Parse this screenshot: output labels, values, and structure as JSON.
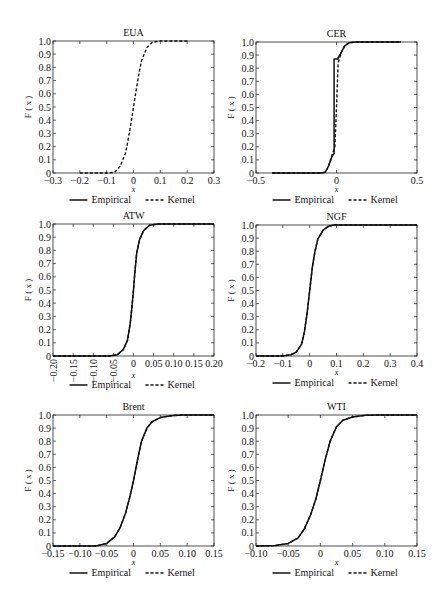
{
  "figure": {
    "legend": {
      "empirical_label": "Empirical",
      "kernel_label": "Kernel"
    },
    "ylabel": "F ( x )",
    "xlabel": "x"
  },
  "chart_data": [
    {
      "type": "line",
      "title": "EUA",
      "xlabel": "x",
      "ylabel": "F ( x )",
      "xlim": [
        -0.3,
        0.3
      ],
      "ylim": [
        0,
        1.0
      ],
      "xticks": [
        -0.3,
        -0.2,
        -0.1,
        0,
        0.1,
        0.2,
        0.3
      ],
      "xtick_labels": [
        "-0.3",
        "-0.2",
        "-0.1",
        "0",
        "0.1",
        "0.2",
        "0.3"
      ],
      "xtick_rotated": false,
      "yticks": [
        0,
        0.1,
        0.2,
        0.3,
        0.4,
        0.5,
        0.6,
        0.7,
        0.8,
        0.9,
        1.0
      ],
      "ytick_labels": [
        "0",
        "0.1",
        "0.2",
        "0.3",
        "0.4",
        "0.5",
        "0.6",
        "0.7",
        "0.8",
        "0.9",
        "1.0"
      ],
      "legend_position": "bottom",
      "series": [
        {
          "name": "Kernel",
          "style": "dashed",
          "x": [
            -0.2,
            -0.1,
            -0.07,
            -0.05,
            -0.03,
            -0.02,
            -0.01,
            0,
            0.01,
            0.02,
            0.03,
            0.05,
            0.07,
            0.1,
            0.2
          ],
          "y": [
            0,
            0,
            0.005,
            0.05,
            0.15,
            0.25,
            0.37,
            0.5,
            0.63,
            0.75,
            0.85,
            0.95,
            0.99,
            1.0,
            1.0
          ]
        }
      ]
    },
    {
      "type": "line",
      "title": "CER",
      "xlabel": "x",
      "ylabel": "F ( x )",
      "xlim": [
        -0.5,
        0.5
      ],
      "ylim": [
        0,
        1.0
      ],
      "xticks": [
        -0.5,
        0,
        0.5
      ],
      "xtick_labels": [
        "-0.5",
        "0",
        "0.5"
      ],
      "xtick_rotated": false,
      "yticks": [
        0,
        0.1,
        0.2,
        0.3,
        0.4,
        0.5,
        0.6,
        0.7,
        0.8,
        0.9,
        1.0
      ],
      "ytick_labels": [
        "0",
        "0.1",
        "0.2",
        "0.3",
        "0.4",
        "0.5",
        "0.6",
        "0.7",
        "0.8",
        "0.9",
        "1.0"
      ],
      "legend_position": "bottom",
      "series": [
        {
          "name": "Empirical",
          "style": "solid",
          "x": [
            -0.4,
            -0.1,
            -0.07,
            -0.05,
            -0.03,
            -0.015,
            -0.015,
            0.01,
            0.01,
            0.03,
            0.05,
            0.08,
            0.12,
            0.4
          ],
          "y": [
            0,
            0,
            0.005,
            0.05,
            0.12,
            0.15,
            0.87,
            0.87,
            0.88,
            0.92,
            0.97,
            0.995,
            1.0,
            1.0
          ]
        },
        {
          "name": "Kernel",
          "style": "dashed",
          "x": [
            -0.4,
            -0.1,
            -0.07,
            -0.05,
            -0.03,
            -0.01,
            0,
            0.01,
            0.03,
            0.05,
            0.08,
            0.12,
            0.4
          ],
          "y": [
            0,
            0,
            0.005,
            0.05,
            0.13,
            0.2,
            0.5,
            0.84,
            0.92,
            0.97,
            0.995,
            1.0,
            1.0
          ]
        }
      ]
    },
    {
      "type": "line",
      "title": "ATW",
      "xlabel": "x",
      "ylabel": "F ( x )",
      "xlim": [
        -0.2,
        0.2
      ],
      "ylim": [
        0,
        1.0
      ],
      "xticks": [
        -0.2,
        -0.15,
        -0.1,
        -0.05,
        0,
        0.05,
        0.1,
        0.15,
        0.2
      ],
      "xtick_labels": [
        "-0.20",
        "-0.15",
        "-0.10",
        "-0.05",
        "0",
        "0.05",
        "0.10",
        "0.15",
        "0.20"
      ],
      "xtick_rotated": true,
      "yticks": [
        0,
        0.1,
        0.2,
        0.3,
        0.4,
        0.5,
        0.6,
        0.7,
        0.8,
        0.9,
        1.0
      ],
      "ytick_labels": [
        "0",
        "0.1",
        "0.2",
        "0.3",
        "0.4",
        "0.5",
        "0.6",
        "0.7",
        "0.8",
        "0.9",
        "1.0"
      ],
      "legend_position": "bottom",
      "series": [
        {
          "name": "Empirical",
          "style": "solid",
          "x": [
            -0.2,
            -0.06,
            -0.04,
            -0.025,
            -0.015,
            -0.008,
            -0.003,
            0,
            0.003,
            0.008,
            0.015,
            0.025,
            0.04,
            0.06,
            0.2
          ],
          "y": [
            0,
            0,
            0.01,
            0.05,
            0.12,
            0.25,
            0.4,
            0.5,
            0.62,
            0.78,
            0.88,
            0.95,
            0.99,
            1.0,
            1.0
          ]
        },
        {
          "name": "Kernel",
          "style": "dashed",
          "x": [
            -0.2,
            -0.06,
            -0.04,
            -0.025,
            -0.015,
            -0.008,
            -0.003,
            0,
            0.003,
            0.008,
            0.015,
            0.025,
            0.04,
            0.06,
            0.2
          ],
          "y": [
            0,
            0,
            0.01,
            0.05,
            0.12,
            0.25,
            0.4,
            0.5,
            0.62,
            0.78,
            0.88,
            0.95,
            0.99,
            1.0,
            1.0
          ]
        }
      ]
    },
    {
      "type": "line",
      "title": "NGF",
      "xlabel": "x",
      "ylabel": "F ( x )",
      "xlim": [
        -0.2,
        0.4
      ],
      "ylim": [
        0,
        1.0
      ],
      "xticks": [
        -0.2,
        -0.1,
        0,
        0.1,
        0.2,
        0.3,
        0.4
      ],
      "xtick_labels": [
        "-0.2",
        "-0.1",
        "0",
        "0.1",
        "0.2",
        "0.3",
        "0.4"
      ],
      "xtick_rotated": false,
      "yticks": [
        0,
        0.1,
        0.2,
        0.3,
        0.4,
        0.5,
        0.6,
        0.7,
        0.8,
        0.9,
        1.0
      ],
      "ytick_labels": [
        "0",
        "0.1",
        "0.2",
        "0.3",
        "0.4",
        "0.5",
        "0.6",
        "0.7",
        "0.8",
        "0.9",
        "1.0"
      ],
      "legend_position": "bottom",
      "series": [
        {
          "name": "Empirical",
          "style": "solid",
          "x": [
            -0.2,
            -0.1,
            -0.07,
            -0.05,
            -0.03,
            -0.02,
            -0.01,
            0,
            0.01,
            0.02,
            0.03,
            0.05,
            0.07,
            0.09,
            0.4
          ],
          "y": [
            0,
            0,
            0.01,
            0.03,
            0.09,
            0.18,
            0.32,
            0.5,
            0.68,
            0.8,
            0.89,
            0.96,
            0.99,
            1.0,
            1.0
          ]
        },
        {
          "name": "Kernel",
          "style": "dashed",
          "x": [
            -0.2,
            -0.1,
            -0.07,
            -0.05,
            -0.03,
            -0.02,
            -0.01,
            0,
            0.01,
            0.02,
            0.03,
            0.05,
            0.07,
            0.09,
            0.4
          ],
          "y": [
            0,
            0,
            0.01,
            0.03,
            0.09,
            0.18,
            0.32,
            0.5,
            0.68,
            0.8,
            0.89,
            0.96,
            0.99,
            1.0,
            1.0
          ]
        }
      ]
    },
    {
      "type": "line",
      "title": "Brent",
      "xlabel": "x",
      "ylabel": "F ( x )",
      "xlim": [
        -0.15,
        0.15
      ],
      "ylim": [
        0,
        1.0
      ],
      "xticks": [
        -0.15,
        -0.1,
        -0.05,
        0,
        0.05,
        0.1,
        0.15
      ],
      "xtick_labels": [
        "-0.15",
        "-0.10",
        "-0.05",
        "0",
        "0.05",
        "0.10",
        "0.15"
      ],
      "xtick_rotated": false,
      "yticks": [
        0,
        0.1,
        0.2,
        0.3,
        0.4,
        0.5,
        0.6,
        0.7,
        0.8,
        0.9,
        1.0
      ],
      "ytick_labels": [
        "0",
        "0.1",
        "0.2",
        "0.3",
        "0.4",
        "0.5",
        "0.6",
        "0.7",
        "0.8",
        "0.9",
        "1.0"
      ],
      "legend_position": "bottom",
      "series": [
        {
          "name": "Empirical",
          "style": "solid",
          "x": [
            -0.15,
            -0.07,
            -0.05,
            -0.035,
            -0.025,
            -0.015,
            -0.007,
            0,
            0.007,
            0.015,
            0.025,
            0.035,
            0.05,
            0.07,
            0.09,
            0.15
          ],
          "y": [
            0,
            0,
            0.02,
            0.07,
            0.14,
            0.25,
            0.37,
            0.5,
            0.65,
            0.8,
            0.9,
            0.95,
            0.98,
            0.995,
            1.0,
            1.0
          ]
        },
        {
          "name": "Kernel",
          "style": "dashed",
          "x": [
            -0.15,
            -0.07,
            -0.05,
            -0.035,
            -0.025,
            -0.015,
            -0.007,
            0,
            0.007,
            0.015,
            0.025,
            0.035,
            0.05,
            0.07,
            0.09,
            0.15
          ],
          "y": [
            0,
            0,
            0.02,
            0.07,
            0.14,
            0.25,
            0.37,
            0.5,
            0.65,
            0.8,
            0.9,
            0.95,
            0.98,
            0.995,
            1.0,
            1.0
          ]
        }
      ]
    },
    {
      "type": "line",
      "title": "WTI",
      "xlabel": "x",
      "ylabel": "F ( x )",
      "xlim": [
        -0.1,
        0.15
      ],
      "ylim": [
        0,
        1.0
      ],
      "xticks": [
        -0.1,
        -0.05,
        0,
        0.05,
        0.1,
        0.15
      ],
      "xtick_labels": [
        "-0.10",
        "-0.05",
        "0",
        "0.05",
        "0.10",
        "0.15"
      ],
      "xtick_rotated": false,
      "yticks": [
        0,
        0.1,
        0.2,
        0.3,
        0.4,
        0.5,
        0.6,
        0.7,
        0.8,
        0.9,
        1.0
      ],
      "ytick_labels": [
        "0",
        "0.1",
        "0.2",
        "0.3",
        "0.4",
        "0.5",
        "0.6",
        "0.7",
        "0.8",
        "0.9",
        "1.0"
      ],
      "legend_position": "bottom",
      "series": [
        {
          "name": "Empirical",
          "style": "solid",
          "x": [
            -0.1,
            -0.07,
            -0.05,
            -0.035,
            -0.025,
            -0.015,
            -0.007,
            0,
            0.007,
            0.015,
            0.025,
            0.035,
            0.05,
            0.07,
            0.09,
            0.15
          ],
          "y": [
            0,
            0.003,
            0.02,
            0.06,
            0.13,
            0.24,
            0.36,
            0.5,
            0.65,
            0.8,
            0.91,
            0.96,
            0.985,
            0.998,
            1.0,
            1.0
          ]
        },
        {
          "name": "Kernel",
          "style": "dashed",
          "x": [
            -0.1,
            -0.07,
            -0.05,
            -0.035,
            -0.025,
            -0.015,
            -0.007,
            0,
            0.007,
            0.015,
            0.025,
            0.035,
            0.05,
            0.07,
            0.09,
            0.15
          ],
          "y": [
            0,
            0.003,
            0.02,
            0.06,
            0.13,
            0.24,
            0.36,
            0.5,
            0.65,
            0.8,
            0.91,
            0.96,
            0.985,
            0.998,
            1.0,
            1.0
          ]
        }
      ]
    }
  ]
}
